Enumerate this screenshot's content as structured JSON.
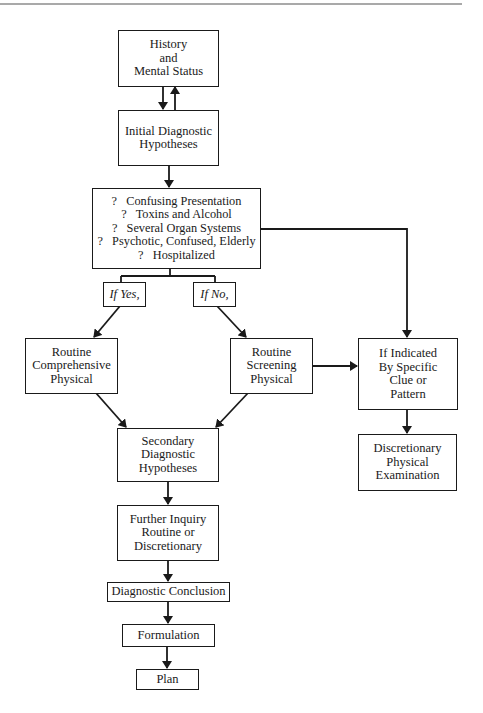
{
  "diagram": {
    "type": "flowchart",
    "nodes": {
      "history": {
        "lines": [
          "History",
          "and",
          "Mental Status"
        ]
      },
      "initial": {
        "lines": [
          "Initial Diagnostic",
          "Hypotheses"
        ]
      },
      "questions": {
        "lines": [
          "?   Confusing Presentation",
          "?   Toxins and Alcohol",
          "?   Several Organ Systems",
          "?   Psychotic, Confused, Elderly",
          "?   Hospitalized"
        ]
      },
      "if_yes": {
        "lines": [
          "If Yes,"
        ]
      },
      "if_no": {
        "lines": [
          "If No,"
        ]
      },
      "comprehensive": {
        "lines": [
          "Routine",
          "Comprehensive",
          "Physical"
        ]
      },
      "screening": {
        "lines": [
          "Routine",
          "Screening",
          "Physical"
        ]
      },
      "indicated": {
        "lines": [
          "If Indicated",
          "By Specific",
          "Clue or",
          "Pattern"
        ]
      },
      "discretionary": {
        "lines": [
          "Discretionary",
          "Physical",
          "Examination"
        ]
      },
      "secondary": {
        "lines": [
          "Secondary",
          "Diagnostic",
          "Hypotheses"
        ]
      },
      "further": {
        "lines": [
          "Further Inquiry",
          "Routine or",
          "Discretionary"
        ]
      },
      "conclusion": {
        "lines": [
          "Diagnostic Conclusion"
        ]
      },
      "formulation": {
        "lines": [
          "Formulation"
        ]
      },
      "plan": {
        "lines": [
          "Plan"
        ]
      }
    },
    "edges": [
      {
        "from": "history",
        "to": "initial"
      },
      {
        "from": "initial",
        "to": "history"
      },
      {
        "from": "initial",
        "to": "questions"
      },
      {
        "from": "questions",
        "to": "if_yes"
      },
      {
        "from": "questions",
        "to": "if_no"
      },
      {
        "from": "questions",
        "to": "indicated"
      },
      {
        "from": "if_yes",
        "to": "comprehensive"
      },
      {
        "from": "if_no",
        "to": "screening"
      },
      {
        "from": "screening",
        "to": "indicated"
      },
      {
        "from": "indicated",
        "to": "discretionary"
      },
      {
        "from": "comprehensive",
        "to": "secondary"
      },
      {
        "from": "screening",
        "to": "secondary"
      },
      {
        "from": "secondary",
        "to": "further"
      },
      {
        "from": "further",
        "to": "conclusion"
      },
      {
        "from": "conclusion",
        "to": "formulation"
      },
      {
        "from": "formulation",
        "to": "plan"
      }
    ],
    "colors": {
      "ink": "#1a1a1a",
      "background": "#ffffff"
    }
  }
}
